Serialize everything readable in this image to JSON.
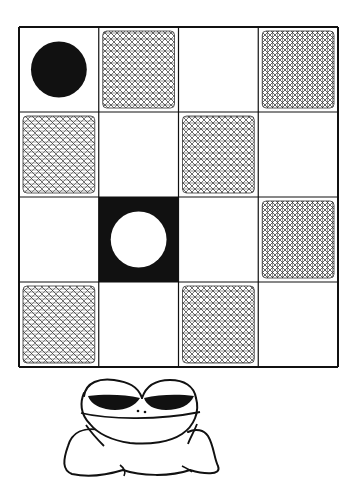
{
  "illustration": {
    "subject": "checkerboard-with-frog",
    "colors": {
      "ink": "#111111",
      "paper": "#ffffff"
    },
    "grid": {
      "rows": 4,
      "cols": 4,
      "x": 19,
      "y": 27,
      "width": 319,
      "height": 340,
      "cells": [
        [
          "white-black-disc",
          "hatched",
          "white",
          "hatched"
        ],
        [
          "hatched",
          "white",
          "hatched",
          "white"
        ],
        [
          "white",
          "black-white-disc",
          "white",
          "hatched"
        ],
        [
          "hatched",
          "white",
          "hatched",
          "white"
        ]
      ]
    },
    "pieces": [
      {
        "name": "black-disc",
        "row": 0,
        "col": 0,
        "color": "#111111"
      },
      {
        "name": "white-disc",
        "row": 2,
        "col": 1,
        "color": "#ffffff"
      }
    ],
    "character": {
      "name": "frog",
      "eyes": "half-closed",
      "position": "below-board"
    }
  }
}
